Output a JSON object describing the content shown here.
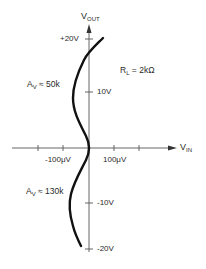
{
  "axes": {
    "y_label_main": "V",
    "y_label_sub": "OUT",
    "x_label_main": "V",
    "x_label_sub": "IN",
    "y_ticks": [
      {
        "label": "+20V",
        "value": 20
      },
      {
        "label": "10V",
        "value": 10
      },
      {
        "label": "-10V",
        "value": -10
      },
      {
        "label": "-20V",
        "value": -20
      }
    ],
    "x_ticks": [
      {
        "label": "-100μV",
        "value": -100
      },
      {
        "label": "100μV",
        "value": 100
      }
    ]
  },
  "annotations": {
    "load": "R",
    "load_sub": "L",
    "load_value": "= 2kΩ",
    "gain_upper_main": "A",
    "gain_upper_sub": "V",
    "gain_upper_value": "≈ 50k",
    "gain_lower_main": "A",
    "gain_lower_sub": "V",
    "gain_lower_value": "≈ 130k"
  },
  "colors": {
    "curve": "#111111",
    "axis": "#555555",
    "text": "#2a2a2a"
  }
}
